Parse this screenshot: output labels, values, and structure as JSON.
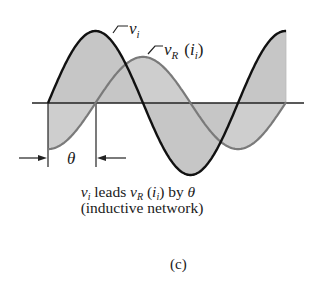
{
  "figure": {
    "panel_label": "(c)",
    "caption": {
      "line1": {
        "v_symbol": "v",
        "v_sub": "i",
        "text_leads": " leads ",
        "vr_symbol": "v",
        "vr_sub": "R",
        "paren_open": " (",
        "i_symbol": "i",
        "i_sub": "i",
        "paren_close": ") by ",
        "theta": "θ"
      },
      "line2": "(inductive network)"
    },
    "curve_labels": {
      "vi": {
        "symbol": "v",
        "sub": "i"
      },
      "vr": {
        "symbol": "v",
        "sub": "R",
        "paren_open": "(",
        "i_symbol": "i",
        "i_sub": "i",
        "paren_close": ")"
      }
    },
    "phase_label": "θ",
    "colors": {
      "vi_curve": "#111111",
      "vr_curve": "#7a7a7a",
      "fill": "#c4c4c4",
      "axis": "#222222"
    }
  },
  "chart_data": {
    "type": "line",
    "xlabel": "",
    "ylabel": "",
    "series": [
      {
        "name": "v_i",
        "shape": "sine",
        "amplitude_rel": 1.0,
        "phase_deg": 0,
        "cycles": 1.25,
        "color": "#111111"
      },
      {
        "name": "v_R (i_i)",
        "shape": "sine",
        "amplitude_rel": 0.64,
        "phase_deg": -90,
        "cycles": 1.25,
        "color": "#7a7a7a"
      }
    ],
    "phase_shift": {
      "label": "θ",
      "value_deg": 90
    },
    "grid": false,
    "legend": "inline labels"
  }
}
